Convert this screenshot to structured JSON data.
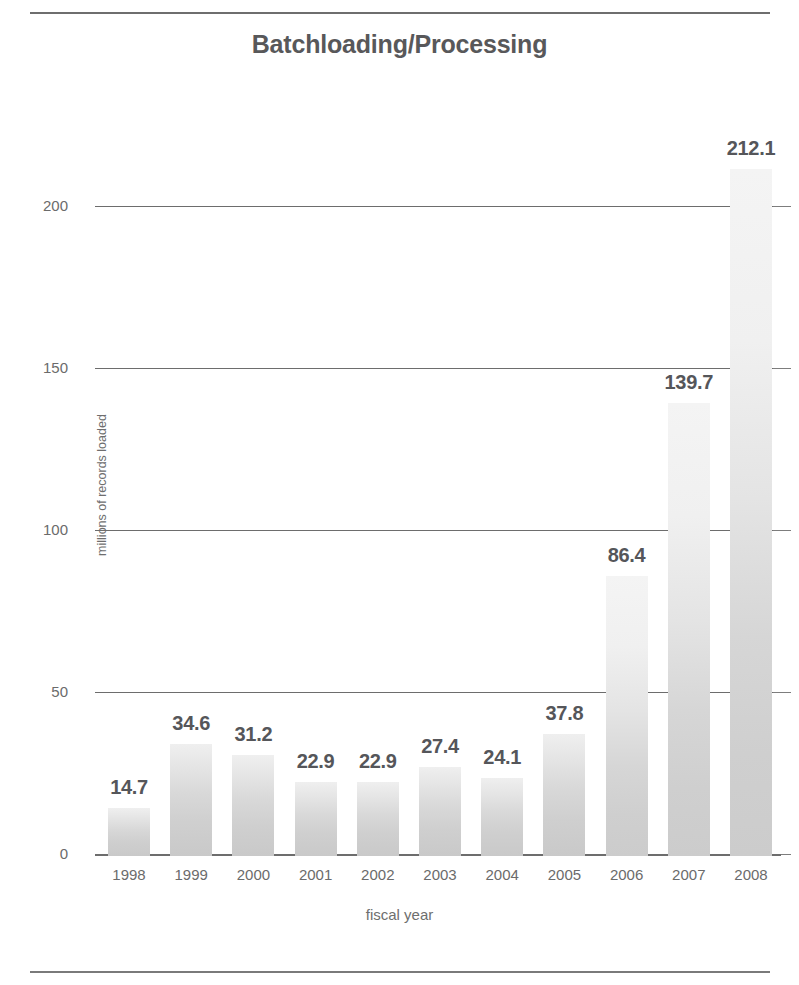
{
  "page": {
    "top_rule": "",
    "bottom_rule": ""
  },
  "chart_data": {
    "type": "bar",
    "title": "Batchloading/Processing",
    "xlabel": "fiscal year",
    "ylabel": "millions of records loaded",
    "categories": [
      "1998",
      "1999",
      "2000",
      "2001",
      "2002",
      "2003",
      "2004",
      "2005",
      "2006",
      "2007",
      "2008"
    ],
    "values": [
      14.7,
      34.6,
      31.2,
      22.9,
      22.9,
      27.4,
      24.1,
      37.8,
      86.4,
      139.7,
      212.1
    ],
    "value_labels": [
      "14.7",
      "34.6",
      "31.2",
      "22.9",
      "22.9",
      "27.4",
      "24.1",
      "37.8",
      "86.4",
      "139.7",
      "212.1"
    ],
    "ylim": [
      0,
      212.1
    ],
    "yticks": [
      0,
      50,
      100,
      150,
      200
    ],
    "ytick_labels": [
      "0",
      "50",
      "100",
      "150",
      "200"
    ],
    "grid": true,
    "legend": null,
    "bar_color": "#d8d8d8",
    "axis_color": "#6d6d6d",
    "text_color": "#5a5a5a"
  }
}
